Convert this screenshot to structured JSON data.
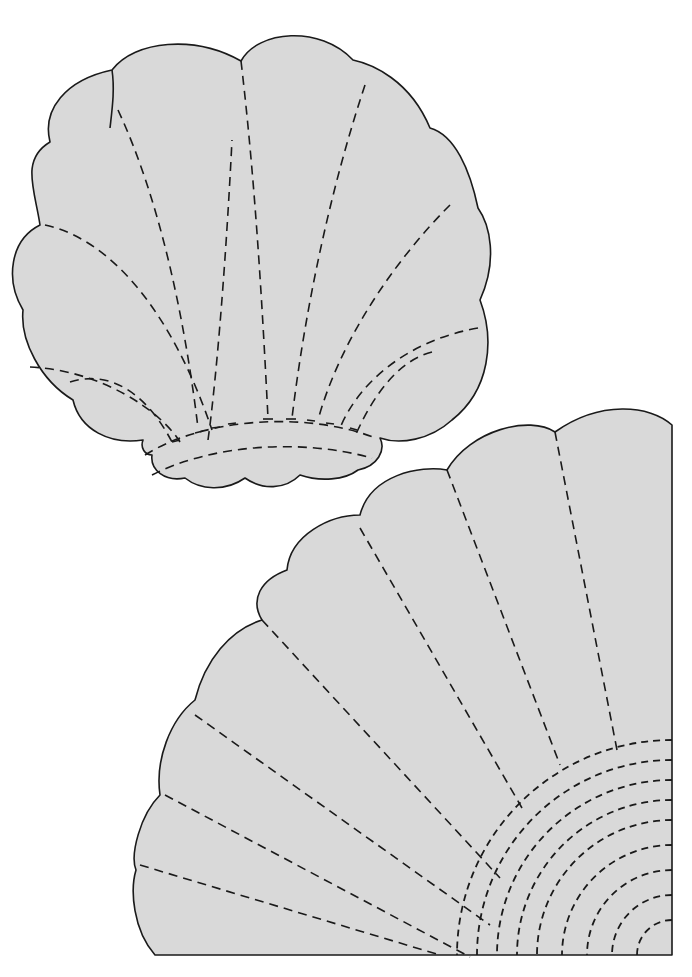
{
  "page": {
    "colors": {
      "background": "#ffffff",
      "fill": "#d9d9d9",
      "stroke": "#1a1a1a"
    }
  },
  "shapes": [
    {
      "id": "shell",
      "label": "Scallop shell template",
      "scallops_outer": 9,
      "radial_quilt_lines": 10,
      "base_bands": 2
    },
    {
      "id": "fan",
      "label": "Quarter fan template",
      "blades": 8,
      "radial_quilt_lines": 7,
      "concentric_arcs": 9
    }
  ]
}
